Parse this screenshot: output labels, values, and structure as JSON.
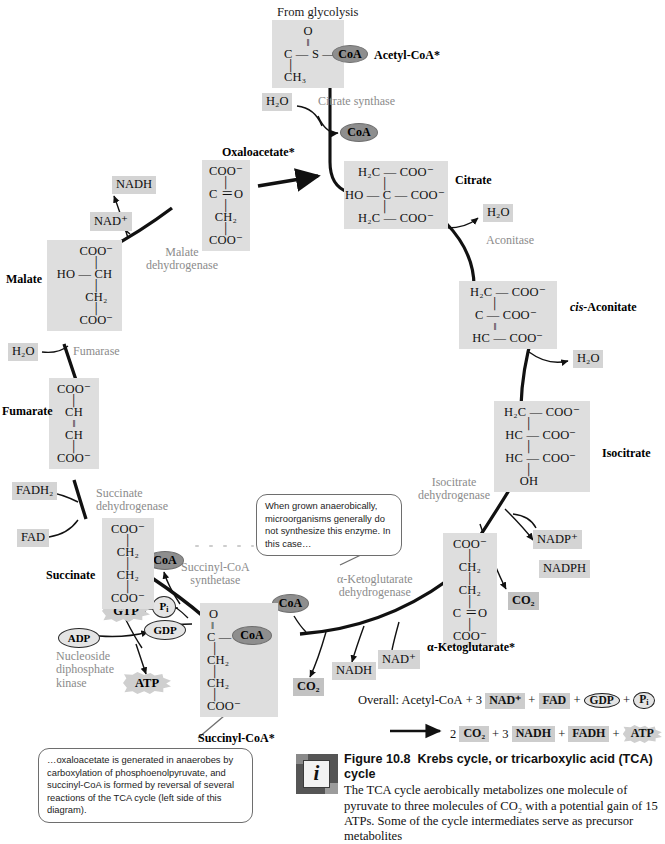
{
  "figure": {
    "from_glycolysis": "From glycolysis",
    "caption_title_prefix": "Figure 10.8",
    "caption_title": "Krebs cycle, or tricarboxylic acid (TCA) cycle",
    "caption_body": "The TCA cycle aerobically metabolizes one molecule of pyruvate to three molecules of CO₂ with a potential gain of 15 ATPs. Some of the cycle intermediates serve as precursor metabolites",
    "info_icon_letter": "i"
  },
  "metabolites": [
    {
      "name": "Acetyl-CoA*",
      "id": "acetyl-coa"
    },
    {
      "name": "Citrate",
      "id": "citrate"
    },
    {
      "name": "cis-Aconitate",
      "id": "cis-aconitate",
      "italic_prefix": "cis",
      "rest": "-Aconitate"
    },
    {
      "name": "Isocitrate",
      "id": "isocitrate"
    },
    {
      "name": "α-Ketoglutarate*",
      "id": "alpha-ketoglutarate"
    },
    {
      "name": "Succinyl-CoA*",
      "id": "succinyl-coa"
    },
    {
      "name": "Succinate",
      "id": "succinate"
    },
    {
      "name": "Fumarate",
      "id": "fumarate"
    },
    {
      "name": "Malate",
      "id": "malate"
    },
    {
      "name": "Oxaloacetate*",
      "id": "oxaloacetate"
    }
  ],
  "structures": {
    "acetyl_coa": {
      "rows": [
        "O",
        "‖",
        "C — S —",
        "│",
        "CH₃"
      ]
    },
    "citrate": {
      "rows": [
        "H₂C — COO⁻",
        "│",
        "HO — C — COO⁻",
        "│",
        "H₂C — COO⁻"
      ]
    },
    "cis_aconitate": {
      "rows": [
        "H₂C — COO⁻",
        "│",
        "C — COO⁻",
        "‖",
        "HC — COO⁻"
      ]
    },
    "isocitrate": {
      "rows": [
        "H₂C — COO⁻",
        "│",
        "HC — COO⁻",
        "│",
        "HC — COO⁻",
        "│",
        "OH"
      ]
    },
    "alpha_kg": {
      "rows": [
        "COO⁻",
        "│",
        "CH₂",
        "│",
        "CH₂",
        "│",
        "C ＝O",
        "│",
        "COO⁻"
      ]
    },
    "succinyl_coa": {
      "rows": [
        "O",
        "‖",
        "C — S —",
        "│",
        "CH₂",
        "│",
        "CH₂",
        "│",
        "COO⁻"
      ]
    },
    "succinate": {
      "rows": [
        "COO⁻",
        "│",
        "CH₂",
        "│",
        "CH₂",
        "│",
        "COO⁻"
      ]
    },
    "fumarate": {
      "rows": [
        "COO⁻",
        "│",
        "CH",
        "‖",
        "CH",
        "│",
        "COO⁻"
      ]
    },
    "malate": {
      "rows": [
        "COO⁻",
        "│",
        "HO — CH",
        "│",
        "CH₂",
        "│",
        "COO⁻"
      ]
    },
    "oxaloacetate": {
      "rows": [
        "COO⁻",
        "│",
        "C ＝O",
        "│",
        "CH₂",
        "│",
        "COO⁻"
      ]
    }
  },
  "enzymes": [
    {
      "id": "citrate-synthase",
      "lines": [
        "Citrate synthase"
      ]
    },
    {
      "id": "aconitase",
      "lines": [
        "Aconitase"
      ]
    },
    {
      "id": "isocitrate-dehydrogenase",
      "lines": [
        "Isocitrate",
        "dehydrogenase"
      ]
    },
    {
      "id": "alpha-kg-dehydrogenase",
      "lines": [
        "α-Ketoglutarate",
        "dehydrogenase"
      ]
    },
    {
      "id": "succinyl-coa-synthetase",
      "lines": [
        "Succinyl-CoA",
        "synthetase"
      ]
    },
    {
      "id": "nucleoside-diphosphate-kinase",
      "lines": [
        "Nucleoside",
        "diphosphate",
        "kinase"
      ]
    },
    {
      "id": "succinate-dehydrogenase",
      "lines": [
        "Succinate",
        "dehydrogenase"
      ]
    },
    {
      "id": "fumarase",
      "lines": [
        "Fumarase"
      ]
    },
    {
      "id": "malate-dehydrogenase",
      "lines": [
        "Malate",
        "dehydrogenase"
      ]
    }
  ],
  "cofactors": {
    "coa": "CoA",
    "h2o": "H₂O",
    "nad_plus": "NAD⁺",
    "nadh": "NADH",
    "nadp_plus": "NADP⁺",
    "nadph": "NADPH",
    "co2": "CO₂",
    "fad": "FAD",
    "fadh2": "FADH₂",
    "gtp": "GTP",
    "gdp": "GDP",
    "adp": "ADP",
    "atp": "ATP",
    "pi": "P"
  },
  "callouts": {
    "anaerobic": "When grown anaerobically, microorganisms generally do not synthesize this enzyme. In this case…",
    "oxaloacetate": "…oxaloacetate is generated in anaerobes by carboxylation of phosphoenolpyruvate, and succinyl-CoA is formed by reversal of several reactions of the TCA cycle (left side of this diagram)."
  },
  "overall": {
    "label": "Overall: Acetyl-CoA",
    "line1_tokens": [
      "+ 3",
      "NAD⁺",
      "+",
      "FAD",
      "+",
      "GDP",
      "+",
      "P"
    ],
    "line2_tokens": [
      "2",
      "CO₂",
      "+ 3",
      "NADH",
      "+",
      "FADH",
      "+",
      "ATP"
    ],
    "arrow": "⟶"
  },
  "colors": {
    "box_fill": "#dedede",
    "chip_fill": "#d4d4d4",
    "ellipse_fill": "#8e8e8e",
    "enzyme_text": "#8b8b8b",
    "arrow": "#111111"
  }
}
